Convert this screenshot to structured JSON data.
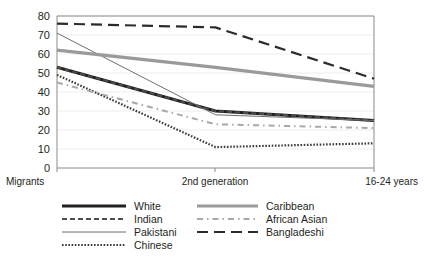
{
  "chart_data": {
    "type": "line",
    "title": "",
    "subtitle": "",
    "xlabel": "",
    "ylabel": "",
    "categories": [
      "Migrants",
      "2nd generation",
      "16-24 years"
    ],
    "x": [
      0,
      1,
      2
    ],
    "ylim": [
      0,
      80
    ],
    "yticks": [
      0,
      10,
      20,
      30,
      40,
      50,
      60,
      70,
      80
    ],
    "ytick_labels": [
      "0",
      "10",
      "20",
      "30",
      "40",
      "50",
      "60",
      "70",
      "80"
    ],
    "grid": true,
    "legend_position": "bottom",
    "series": [
      {
        "name": "White",
        "values": [
          53,
          30,
          25
        ],
        "color": "#231f20",
        "style": "solid",
        "width": 3.0,
        "dash": "none"
      },
      {
        "name": "Indian",
        "values": [
          53,
          30,
          25
        ],
        "color": "#4d4d4d",
        "style": "dashed",
        "width": 2.0,
        "dash": "5,3"
      },
      {
        "name": "Pakistani",
        "values": [
          71,
          28,
          25
        ],
        "color": "#6e6e6e",
        "style": "solid",
        "width": 1.0,
        "dash": "none"
      },
      {
        "name": "Chinese",
        "values": [
          49,
          11,
          13
        ],
        "color": "#3a3a3a",
        "style": "dotted",
        "width": 2.2,
        "dash": "1.6,1.6"
      },
      {
        "name": "Caribbean",
        "values": [
          62,
          53,
          43
        ],
        "color": "#9a9a9a",
        "style": "solid",
        "width": 3.2,
        "dash": "none"
      },
      {
        "name": "African Asian",
        "values": [
          45,
          23,
          21
        ],
        "color": "#a8a8a8",
        "style": "dash-dot",
        "width": 2.0,
        "dash": "6,4,1.5,4"
      },
      {
        "name": "Bangladeshi",
        "values": [
          76,
          74,
          47
        ],
        "color": "#2b2b2b",
        "style": "long-dash",
        "width": 2.2,
        "dash": "11,6"
      }
    ]
  },
  "axis": {
    "y_tick_0": "0",
    "y_tick_10": "10",
    "y_tick_20": "20",
    "y_tick_30": "30",
    "y_tick_40": "40",
    "y_tick_50": "50",
    "y_tick_60": "60",
    "y_tick_70": "70",
    "y_tick_80": "80",
    "cat_0": "Migrants",
    "cat_1": "2nd generation",
    "cat_2": "16-24 years"
  },
  "legend": {
    "column_left": [
      {
        "label": "White"
      },
      {
        "label": "Indian"
      },
      {
        "label": "Pakistani"
      },
      {
        "label": "Chinese"
      }
    ],
    "column_right": [
      {
        "label": "Caribbean"
      },
      {
        "label": "African Asian"
      },
      {
        "label": "Bangladeshi"
      }
    ]
  },
  "colors": {
    "background": "#ffffff",
    "text": "#231f20",
    "axis": "#8a8a8a",
    "grid": "#e9e9e9"
  }
}
